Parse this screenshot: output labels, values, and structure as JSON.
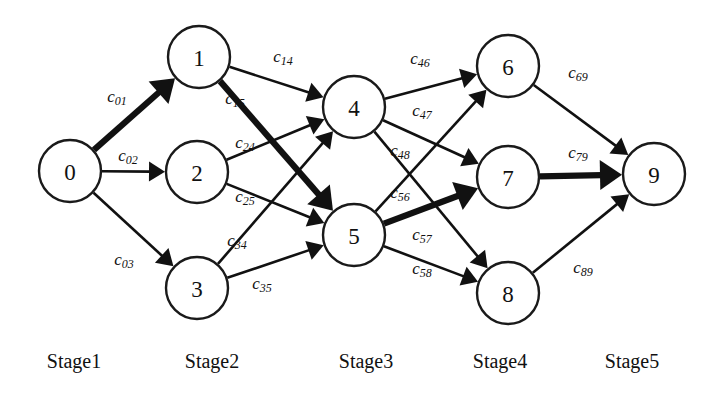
{
  "diagram": {
    "type": "multistage-graph",
    "title": "",
    "canvas": {
      "width": 716,
      "height": 409
    },
    "node_radius": 31,
    "colors": {
      "background": "#ffffff",
      "stroke": "#111111",
      "node_fill": "#ffffff",
      "highlight": "#111111"
    },
    "highlighted_path": [
      "0",
      "1",
      "5",
      "7",
      "9"
    ],
    "nodes": [
      {
        "id": "0",
        "label": "0",
        "x": 70,
        "y": 171,
        "stage": 1
      },
      {
        "id": "1",
        "label": "1",
        "x": 199,
        "y": 57,
        "stage": 2
      },
      {
        "id": "2",
        "label": "2",
        "x": 197,
        "y": 172,
        "stage": 2
      },
      {
        "id": "3",
        "label": "3",
        "x": 197,
        "y": 288,
        "stage": 2
      },
      {
        "id": "4",
        "label": "4",
        "x": 354,
        "y": 107,
        "stage": 3
      },
      {
        "id": "5",
        "label": "5",
        "x": 354,
        "y": 235,
        "stage": 3
      },
      {
        "id": "6",
        "label": "6",
        "x": 508,
        "y": 66,
        "stage": 4
      },
      {
        "id": "7",
        "label": "7",
        "x": 508,
        "y": 177,
        "stage": 4
      },
      {
        "id": "8",
        "label": "8",
        "x": 508,
        "y": 293,
        "stage": 4
      },
      {
        "id": "9",
        "label": "9",
        "x": 654,
        "y": 174,
        "stage": 5
      }
    ],
    "edges": [
      {
        "id": "e01",
        "from": "0",
        "to": "1",
        "base": "c",
        "sub": "01",
        "bold": true,
        "lx": 117,
        "ly": 96
      },
      {
        "id": "e02",
        "from": "0",
        "to": "2",
        "base": "c",
        "sub": "02",
        "bold": false,
        "lx": 128,
        "ly": 155
      },
      {
        "id": "e03",
        "from": "0",
        "to": "3",
        "base": "c",
        "sub": "03",
        "bold": false,
        "lx": 124,
        "ly": 259
      },
      {
        "id": "e14",
        "from": "1",
        "to": "4",
        "base": "c",
        "sub": "14",
        "bold": false,
        "lx": 283,
        "ly": 56
      },
      {
        "id": "e15",
        "from": "1",
        "to": "5",
        "base": "c",
        "sub": "15",
        "bold": true,
        "lx": 235,
        "ly": 98
      },
      {
        "id": "e24",
        "from": "2",
        "to": "4",
        "base": "c",
        "sub": "24",
        "bold": false,
        "lx": 245,
        "ly": 142
      },
      {
        "id": "e25",
        "from": "2",
        "to": "5",
        "base": "c",
        "sub": "25",
        "bold": false,
        "lx": 245,
        "ly": 196
      },
      {
        "id": "e34",
        "from": "3",
        "to": "4",
        "base": "c",
        "sub": "34",
        "bold": false,
        "lx": 237,
        "ly": 240
      },
      {
        "id": "e35",
        "from": "3",
        "to": "5",
        "base": "c",
        "sub": "35",
        "bold": false,
        "lx": 262,
        "ly": 283
      },
      {
        "id": "e46",
        "from": "4",
        "to": "6",
        "base": "c",
        "sub": "46",
        "bold": false,
        "lx": 420,
        "ly": 58
      },
      {
        "id": "e47",
        "from": "4",
        "to": "7",
        "base": "c",
        "sub": "47",
        "bold": false,
        "lx": 422,
        "ly": 110
      },
      {
        "id": "e48",
        "from": "4",
        "to": "8",
        "base": "c",
        "sub": "48",
        "bold": false,
        "lx": 400,
        "ly": 150
      },
      {
        "id": "e56",
        "from": "5",
        "to": "6",
        "base": "c",
        "sub": "56",
        "bold": false,
        "lx": 400,
        "ly": 192
      },
      {
        "id": "e57",
        "from": "5",
        "to": "7",
        "base": "c",
        "sub": "57",
        "bold": true,
        "lx": 422,
        "ly": 234
      },
      {
        "id": "e58",
        "from": "5",
        "to": "8",
        "base": "c",
        "sub": "58",
        "bold": false,
        "lx": 422,
        "ly": 268
      },
      {
        "id": "e69",
        "from": "6",
        "to": "9",
        "base": "c",
        "sub": "69",
        "bold": false,
        "lx": 578,
        "ly": 72
      },
      {
        "id": "e79",
        "from": "7",
        "to": "9",
        "base": "c",
        "sub": "79",
        "bold": true,
        "lx": 578,
        "ly": 152
      },
      {
        "id": "e89",
        "from": "8",
        "to": "9",
        "base": "c",
        "sub": "89",
        "bold": false,
        "lx": 583,
        "ly": 267
      }
    ],
    "stages": [
      {
        "id": "stage1",
        "label": "Stage1",
        "x": 74,
        "y": 350
      },
      {
        "id": "stage2",
        "label": "Stage2",
        "x": 212,
        "y": 350
      },
      {
        "id": "stage3",
        "label": "Stage3",
        "x": 366,
        "y": 350
      },
      {
        "id": "stage4",
        "label": "Stage4",
        "x": 500,
        "y": 350
      },
      {
        "id": "stage5",
        "label": "Stage5",
        "x": 632,
        "y": 350
      }
    ]
  }
}
